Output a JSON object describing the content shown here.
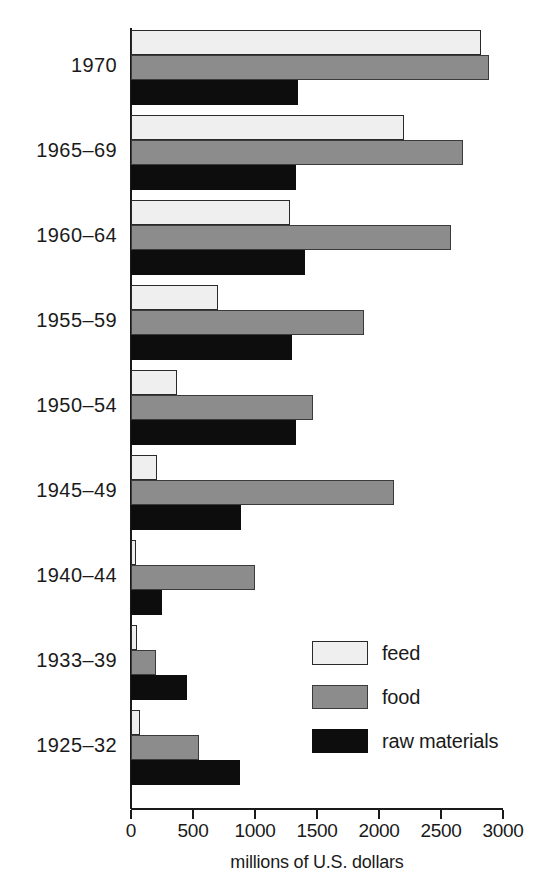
{
  "chart_data": {
    "type": "bar",
    "orientation": "horizontal",
    "title": "",
    "xlabel": "millions of U.S. dollars",
    "ylabel": "",
    "xlim": [
      0,
      3000
    ],
    "xticks": [
      0,
      500,
      1000,
      1500,
      2000,
      2500,
      3000
    ],
    "xtick_labels": [
      "0",
      "500",
      "1000",
      "1500",
      "2000",
      "2500",
      "3000"
    ],
    "grid": false,
    "legend_position": "inside-lower-right",
    "categories": [
      "1970",
      "1965-69",
      "1960-64",
      "1955-59",
      "1950-54",
      "1945-49",
      "1940-44",
      "1933-39",
      "1925-32"
    ],
    "series": [
      {
        "name": "feed",
        "color": "#efefef",
        "values": [
          2820,
          2200,
          1280,
          700,
          370,
          210,
          40,
          50,
          70
        ]
      },
      {
        "name": "food",
        "color": "#8c8c8c",
        "values": [
          2890,
          2680,
          2580,
          1880,
          1470,
          2120,
          1000,
          200,
          550
        ]
      },
      {
        "name": "raw materials",
        "color": "#0d0d0d",
        "values": [
          1350,
          1330,
          1400,
          1300,
          1330,
          890,
          250,
          450,
          880
        ]
      }
    ]
  },
  "legend": {
    "items": [
      {
        "label": "feed",
        "key": "feed"
      },
      {
        "label": "food",
        "key": "food"
      },
      {
        "label": "raw materials",
        "key": "raw"
      }
    ]
  }
}
